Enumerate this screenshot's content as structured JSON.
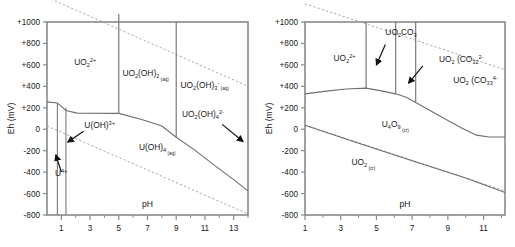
{
  "figure": {
    "type": "pourbaix-diagram-pair"
  },
  "panels": [
    {
      "id": "left",
      "axes": {
        "y_title": "Eh (mV)",
        "x_title": "pH",
        "y_ticks": [
          "+1000",
          "+800",
          "+600",
          "+400",
          "+200",
          "0",
          "-200",
          "-400",
          "-600",
          "-800"
        ],
        "y_values": [
          1000,
          800,
          600,
          400,
          200,
          0,
          -200,
          -400,
          -600,
          -800
        ],
        "y_min": -800,
        "y_max": 1000,
        "x_ticks_major": [
          "1",
          "3",
          "5",
          "7",
          "9",
          "11",
          "13"
        ],
        "x_values_major": [
          1,
          3,
          5,
          7,
          9,
          11,
          13
        ],
        "x_ticks_minor": [
          2,
          4,
          6,
          8,
          10,
          12,
          14
        ],
        "x_min": 0,
        "x_max": 14
      },
      "species": [
        {
          "name": "UO2-2plus",
          "base": "UO",
          "sub1": "2",
          "sup": "2+",
          "tag": "",
          "x": 1.9,
          "y": 600
        },
        {
          "name": "UO2OH2-aq",
          "base": "UO",
          "sub1": "2",
          "mid": "(OH)",
          "sub2": "2",
          "sup": "",
          "tag": "(aq)",
          "x": 5.25,
          "y": 500
        },
        {
          "name": "UO2OH3-minus-aq",
          "base": "UO",
          "sub1": "2",
          "mid": "(OH)",
          "sub2": "3",
          "sup": "-",
          "tag": "(aq)",
          "x": 9.3,
          "y": 380
        },
        {
          "name": "UO2OH4-2minus-aq",
          "base": "UO",
          "sub1": "2",
          "mid": "(OH)",
          "sub2": "4",
          "sup": "2-",
          "tag": "",
          "x": 9.4,
          "y": 110
        },
        {
          "name": "UOH-3plus",
          "base": "U(OH)",
          "sub1": "",
          "sup": "3+",
          "tag": "",
          "x": 2.6,
          "y": 10
        },
        {
          "name": "UOH4-aq",
          "base": "U(OH)",
          "sub1": "4",
          "sup": "",
          "tag": "(aq)",
          "x": 6.4,
          "y": -195
        },
        {
          "name": "U-4plus",
          "base": "U",
          "sub1": "",
          "sup": "4+",
          "tag": "",
          "x": 0.55,
          "y": -440
        }
      ],
      "annotations": [
        {
          "name": "arrow-to-uoh3plus",
          "from_x": 2.55,
          "from_y": -20,
          "to_x": 1.45,
          "to_y": -120
        },
        {
          "name": "arrow-to-u4plus",
          "from_x": 1.0,
          "from_y": -400,
          "to_x": 0.62,
          "to_y": -240
        },
        {
          "name": "arrow-to-uo2oh4",
          "from_x": 12.2,
          "from_y": 45,
          "to_x": 13.65,
          "to_y": -115
        }
      ]
    },
    {
      "id": "right",
      "axes": {
        "y_title": "Eh (mV)",
        "x_title": "pH",
        "y_ticks": [
          "+1000",
          "+800",
          "+600",
          "+400",
          "+200",
          "0",
          "-200",
          "-400",
          "-600",
          "-800"
        ],
        "y_values": [
          1000,
          800,
          600,
          400,
          200,
          0,
          -200,
          -400,
          -600,
          -800
        ],
        "y_min": -800,
        "y_max": 1000,
        "x_ticks_major": [
          "1",
          "3",
          "5",
          "7",
          "9",
          "11"
        ],
        "x_values_major": [
          1,
          3,
          5,
          7,
          9,
          11
        ],
        "x_ticks_minor": [
          2,
          4,
          6,
          8,
          10,
          12
        ],
        "x_min": 1,
        "x_max": 12.2
      },
      "species": [
        {
          "name": "UO2-2plus",
          "base": "UO",
          "sub1": "2",
          "sup": "2+",
          "tag": "",
          "x": 2.6,
          "y": 640
        },
        {
          "name": "UO2CO3",
          "base": "UO",
          "sub1": "2",
          "mid": "CO",
          "sub2": "3",
          "sup": "",
          "tag": "",
          "x": 5.5,
          "y": 880
        },
        {
          "name": "UO2-CO3-2-2minus",
          "base": "UO",
          "sub1": "2",
          "mid": " (CO",
          "sub2": "3",
          "sub3": "2",
          "sup": "2-",
          "tag": "",
          "x": 8.5,
          "y": 625
        },
        {
          "name": "UO2-CO3-3-4minus",
          "base": "UO",
          "sub1": "2",
          "mid": " (CO",
          "sub2": "3",
          "sub3": "3",
          "sup": "4-",
          "tag": "",
          "x": 9.3,
          "y": 430
        },
        {
          "name": "U4O9-cr",
          "base": "U",
          "sub1": "4",
          "mid": "O",
          "sub2": "9",
          "sup": "",
          "tag": "(cr)",
          "x": 5.3,
          "y": 20
        },
        {
          "name": "UO2-cr",
          "base": "UO",
          "sub1": "2",
          "sup": "",
          "tag": "(cr)",
          "x": 3.6,
          "y": -330
        }
      ],
      "annotations": [
        {
          "name": "arrow-to-uo2co3",
          "from_x": 5.5,
          "from_y": 790,
          "to_x": 5.0,
          "to_y": 600
        },
        {
          "name": "arrow-to-uo2co3-2",
          "from_x": 7.6,
          "from_y": 590,
          "to_x": 6.8,
          "to_y": 430
        }
      ]
    }
  ],
  "colors": {
    "axis": "#8a8a8a",
    "boundary_solid": "#6f6f6f",
    "boundary_dashed": "#a8a8a8",
    "text": "#1a1a1a",
    "background": "#ffffff"
  }
}
